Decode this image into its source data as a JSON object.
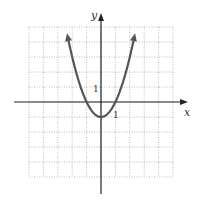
{
  "chart_data": {
    "type": "line",
    "title": "",
    "function": "y = x^2 - 1",
    "xlabel": "x",
    "ylabel": "y",
    "xlim": [
      -5,
      5
    ],
    "ylim": [
      -5,
      5
    ],
    "grid": true,
    "tick_labels": [
      {
        "axis": "x",
        "value": 1,
        "label": "1"
      },
      {
        "axis": "y",
        "value": 1,
        "label": "1"
      }
    ],
    "series": [
      {
        "name": "parabola",
        "x": [
          -2.3,
          -2,
          -1.5,
          -1,
          -0.5,
          0,
          0.5,
          1,
          1.5,
          2,
          2.3
        ],
        "values": [
          4.29,
          3,
          1.25,
          0,
          -0.75,
          -1,
          -0.75,
          0,
          1.25,
          3,
          4.29
        ],
        "color": "#555555",
        "arrows": "both-ends"
      }
    ]
  },
  "labels": {
    "x": "x",
    "y": "y",
    "tick_x": "1",
    "tick_y": "1"
  }
}
